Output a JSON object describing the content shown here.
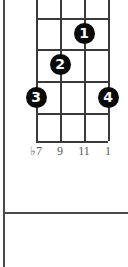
{
  "diagram": {
    "type": "guitar-chord-fretboard",
    "string_count": 4,
    "fret_count": 4,
    "grid": {
      "string_x": [
        0,
        24,
        48,
        72
      ],
      "fret_y": [
        0,
        32,
        63,
        95,
        127,
        155
      ]
    },
    "finger_dots": [
      {
        "label": "1",
        "x": 48,
        "y": 47,
        "string_index": 2,
        "fret_index": 1
      },
      {
        "label": "2",
        "x": 24,
        "y": 78,
        "string_index": 1,
        "fret_index": 2
      },
      {
        "label": "3",
        "x": 0,
        "y": 111,
        "string_index": 0,
        "fret_index": 3
      },
      {
        "label": "4",
        "x": 72,
        "y": 111,
        "string_index": 3,
        "fret_index": 3
      }
    ],
    "interval_labels": [
      {
        "text": "♭7",
        "x": 0
      },
      {
        "text": "9",
        "x": 24
      },
      {
        "text": "11",
        "x": 48
      },
      {
        "text": "1",
        "x": 72
      }
    ],
    "colors": {
      "grid_line": "#3a3a3a",
      "dot_fill": "#0a0a0a",
      "dot_text": "#ffffff",
      "label_text": "#5a5a5a",
      "frame_rule": "#4a4a4a",
      "background": "#ffffff"
    }
  }
}
